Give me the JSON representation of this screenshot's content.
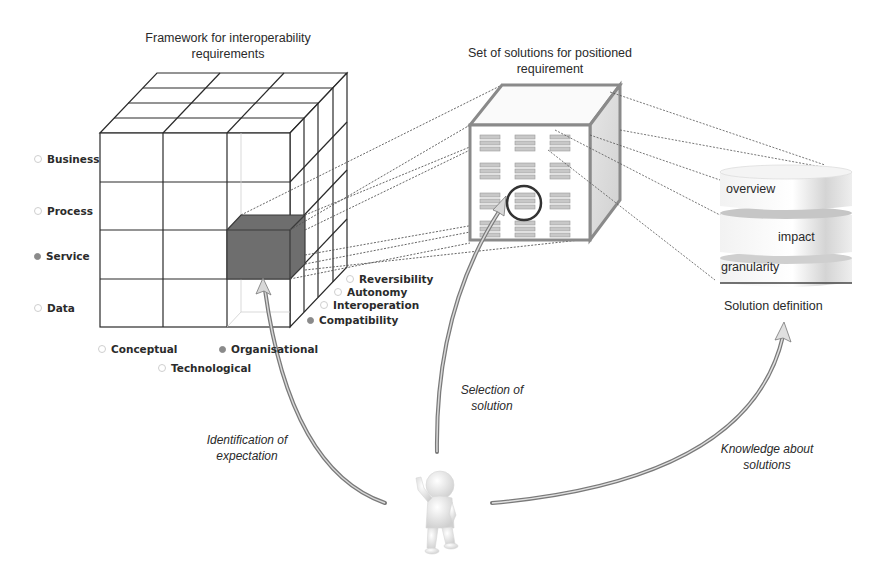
{
  "framework": {
    "title_line1": "Framework for interoperability",
    "title_line2": "requirements",
    "rows": [
      {
        "label": "Business",
        "selected": false
      },
      {
        "label": "Process",
        "selected": false
      },
      {
        "label": "Service",
        "selected": true
      },
      {
        "label": "Data",
        "selected": false
      }
    ],
    "columns": [
      {
        "label": "Conceptual",
        "selected": false
      },
      {
        "label": "Technological",
        "selected": false
      },
      {
        "label": "Organisational",
        "selected": true
      }
    ],
    "depth": [
      {
        "label": "Reversibility",
        "selected": false
      },
      {
        "label": "Autonomy",
        "selected": false
      },
      {
        "label": "Interoperation",
        "selected": false
      },
      {
        "label": "Compatibility",
        "selected": true
      }
    ],
    "highlight_color": "#6e6e6e"
  },
  "solutions": {
    "title_line1": "Set of solutions for positioned",
    "title_line2": "requirement",
    "grid": "3x4",
    "selected_cell": "row 3, column 2"
  },
  "solution_definition": {
    "layers": [
      "overview",
      "impact",
      "granularity"
    ],
    "caption": "Solution definition"
  },
  "arrows": {
    "identification": {
      "line1": "Identification of",
      "line2": "expectation"
    },
    "selection": {
      "line1": "Selection of",
      "line2": "solution"
    },
    "knowledge": {
      "line1": "Knowledge about",
      "line2": "solutions"
    }
  },
  "actor": {
    "icon": "person-thumbs-up-icon"
  }
}
